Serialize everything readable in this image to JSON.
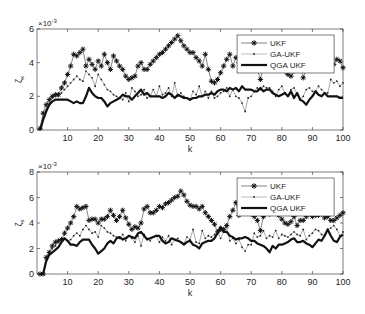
{
  "chart_data": [
    {
      "type": "line",
      "xlabel": "k",
      "ylabel": "ζ",
      "ylabel_sub": "x",
      "exponent_label": "×10",
      "exponent_power": "-3",
      "xlim": [
        0,
        100
      ],
      "ylim": [
        0,
        6
      ],
      "xticks": [
        10,
        20,
        30,
        40,
        50,
        60,
        70,
        80,
        90,
        100
      ],
      "yticks": [
        0,
        2,
        4,
        6
      ],
      "grid": false,
      "legend_position": "top-right",
      "x": [
        1,
        2,
        3,
        4,
        5,
        6,
        7,
        8,
        9,
        10,
        11,
        12,
        13,
        14,
        15,
        16,
        17,
        18,
        19,
        20,
        21,
        22,
        23,
        24,
        25,
        26,
        27,
        28,
        29,
        30,
        31,
        32,
        33,
        34,
        35,
        36,
        37,
        38,
        39,
        40,
        41,
        42,
        43,
        44,
        45,
        46,
        47,
        48,
        49,
        50,
        51,
        52,
        53,
        54,
        55,
        56,
        57,
        58,
        59,
        60,
        61,
        62,
        63,
        64,
        65,
        66,
        67,
        68,
        69,
        70,
        71,
        72,
        73,
        74,
        75,
        76,
        77,
        78,
        79,
        80,
        81,
        82,
        83,
        84,
        85,
        86,
        87,
        88,
        89,
        90,
        91,
        92,
        93,
        94,
        95,
        96,
        97,
        98,
        99,
        100
      ],
      "series": [
        {
          "name": "UKF",
          "style": "star",
          "values": [
            0.1,
            1.0,
            1.5,
            1.8,
            2.0,
            2.1,
            2.1,
            2.5,
            2.8,
            3.3,
            3.8,
            4.5,
            4.4,
            4.6,
            4.8,
            3.8,
            4.2,
            3.9,
            3.6,
            4.1,
            3.8,
            4.5,
            4.0,
            3.6,
            4.4,
            4.1,
            3.8,
            3.6,
            3.2,
            3.0,
            3.1,
            3.2,
            3.8,
            4.0,
            3.6,
            3.6,
            3.9,
            4.1,
            4.3,
            4.5,
            4.6,
            4.8,
            5.0,
            5.2,
            5.4,
            5.6,
            5.3,
            5.0,
            4.8,
            4.6,
            4.6,
            4.3,
            4.1,
            3.8,
            4.5,
            3.6,
            2.9,
            2.8,
            3.0,
            3.4,
            3.8,
            4.2,
            4.5,
            3.8,
            4.3,
            4.0,
            4.8,
            4.5,
            4.1,
            3.8,
            3.7,
            3.6,
            3.0,
            3.8,
            4.2,
            3.6,
            4.3,
            4.3,
            4.5,
            3.7,
            3.5,
            3.3,
            3.2,
            3.5,
            4.2,
            3.9,
            3.1,
            3.6,
            3.9,
            4.4,
            3.6,
            4.0,
            4.5,
            4.1,
            3.6,
            3.9,
            3.9,
            4.2,
            4.1,
            3.7
          ]
        },
        {
          "name": "GA-UKF",
          "style": "dot",
          "values": [
            0.1,
            0.7,
            1.2,
            1.6,
            1.9,
            2.0,
            2.0,
            2.2,
            2.4,
            2.6,
            2.8,
            3.0,
            3.2,
            3.0,
            2.9,
            3.5,
            3.3,
            3.1,
            2.6,
            3.3,
            3.0,
            2.7,
            2.4,
            2.3,
            2.1,
            2.0,
            1.9,
            1.8,
            2.2,
            1.7,
            2.5,
            2.3,
            2.0,
            2.1,
            2.4,
            1.9,
            2.0,
            2.4,
            2.0,
            2.6,
            2.1,
            2.2,
            2.5,
            2.0,
            2.8,
            2.0,
            2.2,
            2.0,
            1.9,
            1.8,
            2.3,
            2.1,
            2.6,
            2.0,
            2.3,
            1.9,
            2.3,
            1.9,
            2.0,
            2.2,
            2.3,
            2.5,
            2.0,
            2.4,
            2.0,
            1.9,
            1.6,
            1.1,
            1.9,
            2.0,
            2.3,
            2.5,
            2.4,
            2.6,
            2.5,
            2.5,
            2.3,
            2.0,
            2.4,
            2.6,
            2.2,
            2.0,
            2.4,
            2.5,
            2.1,
            1.8,
            2.0,
            2.4,
            2.5,
            2.3,
            2.3,
            2.6,
            2.4,
            2.2,
            2.2,
            3.0,
            2.8,
            2.9,
            2.6,
            2.8
          ]
        },
        {
          "name": "QGA UKF",
          "style": "thick",
          "values": [
            0.0,
            0.6,
            1.1,
            1.5,
            1.7,
            1.8,
            1.8,
            1.8,
            1.8,
            1.8,
            1.7,
            1.6,
            1.7,
            1.6,
            1.6,
            2.0,
            2.5,
            2.2,
            2.0,
            1.9,
            1.9,
            1.7,
            1.4,
            1.6,
            1.7,
            1.8,
            1.9,
            2.1,
            2.0,
            2.0,
            1.8,
            2.0,
            2.2,
            2.4,
            2.1,
            2.2,
            2.0,
            2.0,
            2.0,
            2.0,
            1.9,
            2.0,
            2.2,
            2.1,
            1.9,
            2.1,
            2.0,
            1.9,
            1.9,
            1.8,
            1.9,
            1.9,
            2.0,
            2.0,
            2.1,
            2.1,
            2.2,
            2.1,
            2.3,
            2.4,
            2.4,
            2.3,
            2.5,
            2.4,
            2.5,
            2.3,
            2.6,
            2.4,
            2.4,
            2.4,
            2.3,
            2.3,
            2.5,
            2.3,
            2.4,
            2.4,
            2.2,
            2.1,
            2.0,
            2.1,
            2.2,
            2.0,
            2.3,
            1.9,
            2.2,
            1.8,
            1.7,
            1.5,
            1.8,
            2.0,
            2.3,
            2.1,
            2.0,
            2.2,
            2.0,
            2.0,
            2.0,
            2.0,
            1.9,
            1.9
          ]
        }
      ]
    },
    {
      "type": "line",
      "xlabel": "k",
      "ylabel": "ζ",
      "ylabel_sub": "s",
      "exponent_label": "×10",
      "exponent_power": "-3",
      "xlim": [
        0,
        100
      ],
      "ylim": [
        0,
        8
      ],
      "xticks": [
        10,
        20,
        30,
        40,
        50,
        60,
        70,
        80,
        90,
        100
      ],
      "yticks": [
        0,
        2,
        4,
        6,
        8
      ],
      "grid": false,
      "legend_position": "top-right",
      "x": [
        1,
        2,
        3,
        4,
        5,
        6,
        7,
        8,
        9,
        10,
        11,
        12,
        13,
        14,
        15,
        16,
        17,
        18,
        19,
        20,
        21,
        22,
        23,
        24,
        25,
        26,
        27,
        28,
        29,
        30,
        31,
        32,
        33,
        34,
        35,
        36,
        37,
        38,
        39,
        40,
        41,
        42,
        43,
        44,
        45,
        46,
        47,
        48,
        49,
        50,
        51,
        52,
        53,
        54,
        55,
        56,
        57,
        58,
        59,
        60,
        61,
        62,
        63,
        64,
        65,
        66,
        67,
        68,
        69,
        70,
        71,
        72,
        73,
        74,
        75,
        76,
        77,
        78,
        79,
        80,
        81,
        82,
        83,
        84,
        85,
        86,
        87,
        88,
        89,
        90,
        91,
        92,
        93,
        94,
        95,
        96,
        97,
        98,
        99,
        100
      ],
      "series": [
        {
          "name": "UKF",
          "style": "star",
          "values": [
            0.0,
            0.0,
            1.3,
            1.7,
            2.2,
            2.5,
            2.6,
            2.7,
            3.2,
            3.6,
            4.0,
            4.5,
            5.3,
            5.1,
            5.2,
            5.3,
            4.2,
            4.3,
            4.3,
            4.0,
            4.3,
            4.3,
            4.5,
            5.0,
            4.6,
            4.2,
            4.5,
            5.0,
            4.4,
            3.9,
            3.5,
            3.7,
            3.6,
            4.0,
            5.1,
            5.3,
            4.8,
            4.8,
            5.0,
            5.3,
            5.2,
            5.5,
            5.6,
            5.8,
            6.0,
            6.1,
            6.5,
            6.2,
            5.7,
            5.4,
            5.3,
            5.3,
            5.1,
            5.3,
            4.8,
            4.5,
            4.2,
            3.9,
            3.3,
            3.5,
            3.5,
            3.8,
            4.5,
            5.0,
            5.6,
            4.6,
            4.8,
            5.3,
            5.1,
            4.7,
            4.5,
            4.2,
            3.4,
            4.5,
            5.0,
            4.7,
            5.3,
            5.0,
            4.6,
            4.3,
            4.0,
            3.9,
            4.1,
            4.5,
            3.8,
            4.2,
            4.2,
            4.5,
            5.0,
            4.5,
            4.6,
            4.6,
            4.7,
            4.4,
            4.5,
            4.2,
            4.2,
            4.4,
            4.6,
            4.8
          ]
        },
        {
          "name": "GA-UKF",
          "style": "dot",
          "values": [
            0.0,
            0.0,
            1.2,
            1.6,
            2.0,
            2.2,
            2.5,
            2.6,
            2.8,
            2.6,
            2.7,
            3.0,
            3.2,
            3.0,
            3.5,
            3.8,
            3.5,
            3.2,
            3.3,
            2.9,
            3.8,
            3.6,
            3.3,
            3.2,
            3.0,
            2.9,
            2.8,
            3.1,
            2.6,
            3.0,
            2.8,
            2.5,
            3.0,
            2.2,
            3.1,
            2.8,
            2.6,
            2.9,
            3.0,
            2.5,
            2.9,
            2.6,
            3.0,
            2.3,
            2.7,
            2.8,
            2.5,
            2.4,
            2.9,
            2.7,
            3.5,
            2.5,
            2.4,
            3.4,
            2.8,
            3.0,
            2.9,
            3.1,
            3.3,
            2.8,
            3.3,
            3.7,
            2.6,
            2.8,
            2.4,
            2.7,
            2.1,
            1.8,
            2.3,
            2.3,
            3.2,
            2.9,
            3.0,
            3.4,
            2.8,
            3.0,
            2.9,
            3.4,
            2.8,
            3.1,
            3.0,
            2.9,
            3.1,
            3.3,
            3.1,
            3.0,
            3.5,
            2.7,
            3.0,
            3.2,
            3.5,
            3.4,
            3.1,
            3.0,
            3.5,
            3.6,
            3.8,
            3.5,
            3.0,
            3.3
          ]
        },
        {
          "name": "QGA UKF",
          "style": "thick",
          "values": [
            0.0,
            0.0,
            1.0,
            1.5,
            1.7,
            1.9,
            2.1,
            2.5,
            2.8,
            2.6,
            2.3,
            2.3,
            2.2,
            2.5,
            2.7,
            2.7,
            2.7,
            2.3,
            2.0,
            1.6,
            1.8,
            2.0,
            2.4,
            2.6,
            2.4,
            2.8,
            2.9,
            2.7,
            2.8,
            3.0,
            2.9,
            2.8,
            3.2,
            3.3,
            3.0,
            2.7,
            2.8,
            2.9,
            3.0,
            3.0,
            2.6,
            2.4,
            2.5,
            2.8,
            2.7,
            2.6,
            2.5,
            2.3,
            2.5,
            2.6,
            2.3,
            2.2,
            2.0,
            2.4,
            2.5,
            2.6,
            2.6,
            2.8,
            3.2,
            3.7,
            3.3,
            3.3,
            3.0,
            2.9,
            2.7,
            2.8,
            2.8,
            2.9,
            2.8,
            2.6,
            2.6,
            2.4,
            2.3,
            2.2,
            2.0,
            1.7,
            2.2,
            2.0,
            2.3,
            2.3,
            2.4,
            2.5,
            2.7,
            2.8,
            2.5,
            2.5,
            2.6,
            2.4,
            2.3,
            2.1,
            2.4,
            2.7,
            2.6,
            3.0,
            3.5,
            3.0,
            2.6,
            2.5,
            2.9,
            3.1
          ]
        }
      ]
    }
  ]
}
